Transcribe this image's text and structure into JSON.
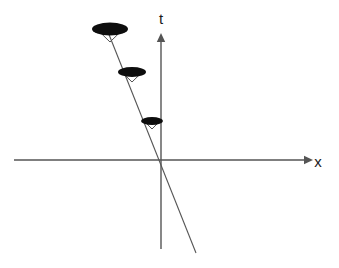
{
  "figure": {
    "background_color": "#ffffff",
    "line_color": "#555555",
    "object_fill_color": "#0d0d0d",
    "label_color": "#1a1a1a"
  },
  "axes": {
    "origin": {
      "x": 160,
      "y": 160
    },
    "horizontal": {
      "name": "x-axis",
      "label": "x",
      "label_position": {
        "x": 318,
        "y": 162
      },
      "start": {
        "x": 14,
        "y": 160
      },
      "end": {
        "x": 313,
        "y": 160
      },
      "arrow": "right"
    },
    "vertical": {
      "name": "t-axis",
      "label": "t",
      "label_position": {
        "x": 161,
        "y": 19
      },
      "start": {
        "x": 161,
        "y": 249
      },
      "end": {
        "x": 161,
        "y": 33
      },
      "arrow": "up"
    }
  },
  "worldline": {
    "name": "worldline",
    "start": {
      "x": 108,
      "y": 32
    },
    "end": {
      "x": 196,
      "y": 253
    },
    "crosses_origin": true
  },
  "objects": [
    {
      "id": "object-top",
      "label": "",
      "center": {
        "x": 110,
        "y": 29
      },
      "canopy_rx": 18,
      "canopy_ry": 6.5,
      "cone_depth": 13,
      "cone_half_width": 11
    },
    {
      "id": "object-middle",
      "label": "",
      "center": {
        "x": 132,
        "y": 72
      },
      "canopy_rx": 14,
      "canopy_ry": 5,
      "cone_depth": 10,
      "cone_half_width": 8.5
    },
    {
      "id": "object-bottom",
      "label": "",
      "center": {
        "x": 152,
        "y": 121
      },
      "canopy_rx": 11,
      "canopy_ry": 4,
      "cone_depth": 8,
      "cone_half_width": 6.5
    }
  ]
}
